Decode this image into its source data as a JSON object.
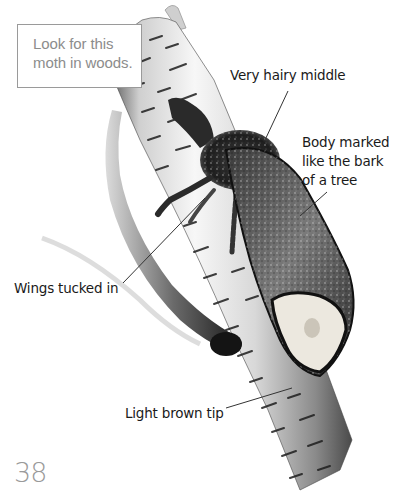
{
  "info_box": {
    "lines": [
      "Look for this",
      "moth in woods."
    ]
  },
  "labels": {
    "hairy_middle": {
      "lines": [
        "Very hairy middle"
      ]
    },
    "body_marked": {
      "lines": [
        "Body marked",
        "like the bark",
        "of a tree"
      ]
    },
    "wings": {
      "lines": [
        "Wings tucked in"
      ]
    },
    "tip": {
      "lines": [
        "Light brown tip"
      ]
    }
  },
  "page_number": "38",
  "colors": {
    "label_text": "#1a1a1a",
    "info_text": "#8c8c8c",
    "info_border": "#9a9a9a",
    "page_number": "#9a9a9a",
    "bark_light": "#f2f2f2",
    "bark_dark": "#6e6e6e",
    "moth_dark": "#1c1c1c",
    "wing_tip": "#e8e4dc"
  }
}
